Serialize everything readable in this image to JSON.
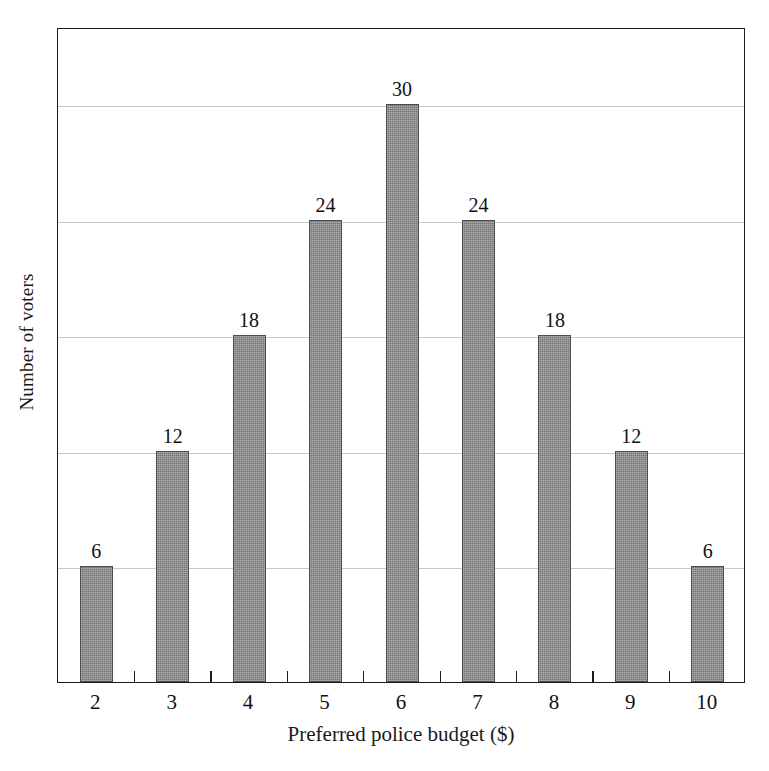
{
  "chart_data": {
    "type": "bar",
    "title": "",
    "xlabel": "Preferred police budget ($)",
    "ylabel": "Number of voters",
    "categories": [
      "2",
      "3",
      "4",
      "5",
      "6",
      "7",
      "8",
      "9",
      "10"
    ],
    "values": [
      6,
      12,
      18,
      24,
      30,
      24,
      18,
      12,
      6
    ],
    "bar_labels": [
      "6",
      "12",
      "18",
      "24",
      "30",
      "24",
      "18",
      "12",
      "6"
    ],
    "ylim": [
      0,
      34
    ],
    "xlim_note": "categorical, ticks drawn between categories",
    "gridlines": [
      6,
      12,
      18,
      24,
      30
    ],
    "grid": true,
    "y_tick_labels": [],
    "legend": null,
    "legend_position": "none",
    "series": [
      {
        "name": "Number of voters",
        "values": [
          6,
          12,
          18,
          24,
          30,
          24,
          18,
          12,
          6
        ]
      }
    ],
    "colors": {
      "bar_fill": "#8c8c8c",
      "bar_edge": "#4d4d4d",
      "grid": "#c9c9c9",
      "frame": "#1b1b1b",
      "text": "#111111",
      "background": "#ffffff"
    }
  }
}
